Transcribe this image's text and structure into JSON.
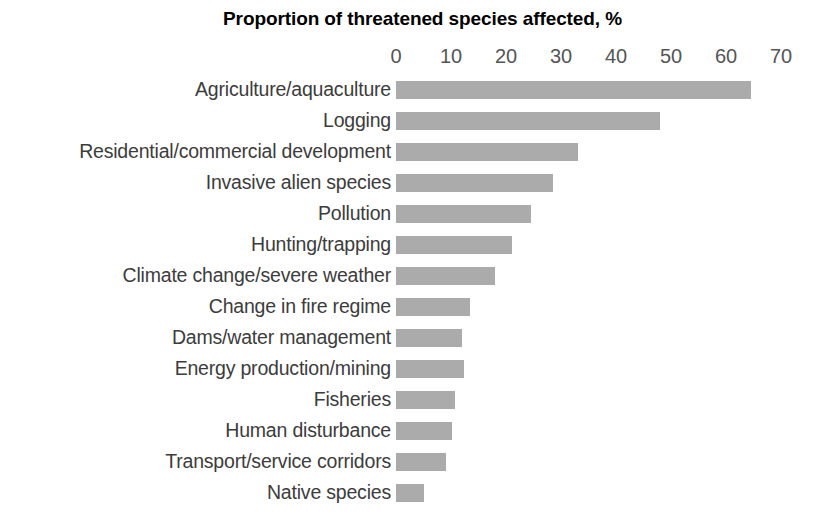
{
  "chart": {
    "title": "Proportion of threatened species affected, %",
    "bar_color": "#ababab",
    "label_color": "#3c3c3c",
    "tick_color": "#555555",
    "title_color": "#000000"
  },
  "chart_data": {
    "type": "bar",
    "orientation": "horizontal",
    "title": "Proportion of threatened species affected, %",
    "xlabel": "Proportion of threatened species affected, %",
    "ylabel": "",
    "xlim": [
      0,
      70
    ],
    "grid": false,
    "legend": false,
    "xticks": [
      0,
      10,
      20,
      30,
      40,
      50,
      60,
      70
    ],
    "xtick_labels": [
      "0",
      "10",
      "20",
      "30",
      "40",
      "50",
      "60",
      "70"
    ],
    "categories": [
      "Agriculture/aquaculture",
      "Logging",
      "Residential/commercial development",
      "Invasive alien species",
      "Pollution",
      "Hunting/trapping",
      "Climate change/severe weather",
      "Change in fire regime",
      "Dams/water management",
      "Energy production/mining",
      "Fisheries",
      "Human disturbance",
      "Transport/service corridors",
      "Native species"
    ],
    "values": [
      64.5,
      48,
      33,
      28.5,
      24.5,
      21,
      18,
      13.5,
      12,
      12.3,
      10.7,
      10.2,
      9,
      5
    ]
  }
}
